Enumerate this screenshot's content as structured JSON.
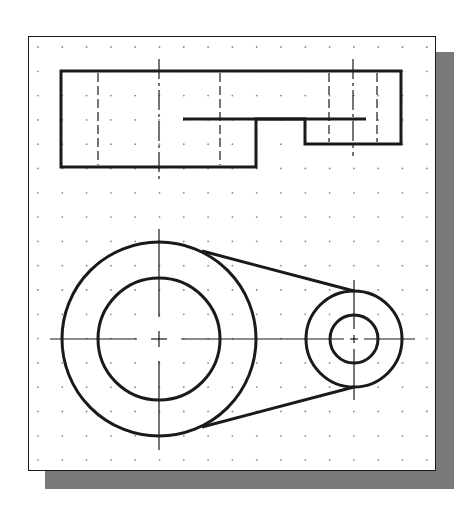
{
  "figure": {
    "title": "Belt drive: top view and front view with grid",
    "colors": {
      "background": "#ffffff",
      "sheet": "#ffffff",
      "line": "#1a1a1a",
      "shadow": "#7a7a7a",
      "grid_dot": "#8a8a8a"
    },
    "grid": {
      "type": "dots",
      "x_start": 38,
      "y_start": 47,
      "spacing": 24.3,
      "columns": 17,
      "rows": 18
    },
    "top_view": {
      "label": "Top view (rectangular profile with hidden lines)",
      "outline_points": "61,71 401,71 401,144 305,144 305,119 256,119 256,167 61,167",
      "inner_edge": {
        "x1": 183,
        "y1": 119,
        "x2": 366,
        "y2": 119
      },
      "hidden_lines_x": [
        98,
        220,
        329,
        377
      ],
      "center_lines": [
        {
          "x": 159,
          "y1": 59,
          "y2": 180
        },
        {
          "x": 353,
          "y1": 59,
          "y2": 156
        }
      ]
    },
    "front_view": {
      "label": "Front view (two pulleys joined by tangent belt lines)",
      "large_pulley": {
        "cx": 159,
        "cy": 339,
        "r_outer": 97,
        "r_inner": 61
      },
      "small_pulley": {
        "cx": 354,
        "cy": 339,
        "r_outer": 48,
        "r_inner": 24
      },
      "belt_upper": {
        "x1": 202,
        "y1": 251,
        "x2": 354,
        "y2": 291
      },
      "belt_lower": {
        "x1": 202,
        "y1": 427,
        "x2": 354,
        "y2": 387
      },
      "center_line_horizontal": {
        "y": 339,
        "x1": 50,
        "x2": 415
      },
      "center_line_large_vertical": {
        "x": 159,
        "y1": 229,
        "y2": 450
      },
      "center_line_small_vertical": {
        "x": 354,
        "y1": 280,
        "y2": 400
      }
    }
  }
}
